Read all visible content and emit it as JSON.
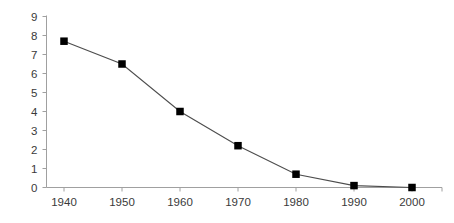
{
  "chart_data": {
    "type": "line",
    "title": "",
    "subtitle": "",
    "xlabel": "",
    "ylabel": "",
    "categories": [
      "1940",
      "1950",
      "1960",
      "1970",
      "1980",
      "1990",
      "2000"
    ],
    "x": [
      1940,
      1950,
      1960,
      1970,
      1980,
      1990,
      2000
    ],
    "values": [
      7.7,
      6.5,
      4.0,
      2.2,
      0.7,
      0.1,
      0.0
    ],
    "series": [
      {
        "name": "",
        "values": [
          7.7,
          6.5,
          4.0,
          2.2,
          0.7,
          0.1,
          0.0
        ]
      }
    ],
    "xlim": [
      1935,
      2005
    ],
    "ylim": [
      0,
      9
    ],
    "y_ticks": [
      0,
      1,
      2,
      3,
      4,
      5,
      6,
      7,
      8,
      9
    ],
    "y_tick_labels": [
      "0",
      "1",
      "2",
      "3",
      "4",
      "5",
      "6",
      "7",
      "8",
      "9"
    ],
    "x_ticks": [
      1940,
      1950,
      1960,
      1970,
      1980,
      1990,
      2000
    ],
    "x_tick_labels": [
      "1940",
      "1950",
      "1960",
      "1970",
      "1980",
      "1990",
      "2000"
    ],
    "grid": false,
    "legend": false,
    "legend_position": "none",
    "marker": "square",
    "marker_color": "#000000",
    "line_color": "#4d4d4d",
    "axis_color": "#a0a0a0",
    "tick_label_color": "#3a3a3a",
    "background_color": "#ffffff",
    "annotations": []
  }
}
